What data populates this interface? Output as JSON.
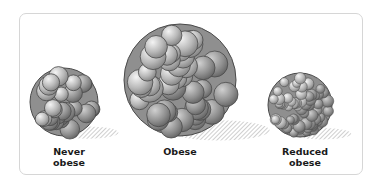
{
  "figure": {
    "panels": [
      {
        "id": "never-obese",
        "label_lines": [
          "Never",
          "obese"
        ],
        "cx": 64,
        "cy": 102,
        "r": 34,
        "cell_r": 8,
        "label_x": 34,
        "label_y": 146
      },
      {
        "id": "obese",
        "label_lines": [
          "Obese"
        ],
        "cx": 180,
        "cy": 80,
        "r": 56,
        "cell_r": 11,
        "label_x": 145,
        "label_y": 146
      },
      {
        "id": "reduced-obese",
        "label_lines": [
          "Reduced",
          "obese"
        ],
        "cx": 300,
        "cy": 105,
        "r": 32,
        "cell_r": 5,
        "label_x": 270,
        "label_y": 146
      }
    ]
  },
  "colors": {
    "frame": "#d6d6d6",
    "cell_fill_light": "#e4e4e4",
    "cell_fill_dark": "#8a8a8a",
    "cell_stroke": "#4a4a4a",
    "shadow": "#b5b5b5",
    "label": "#1a1a1a"
  }
}
